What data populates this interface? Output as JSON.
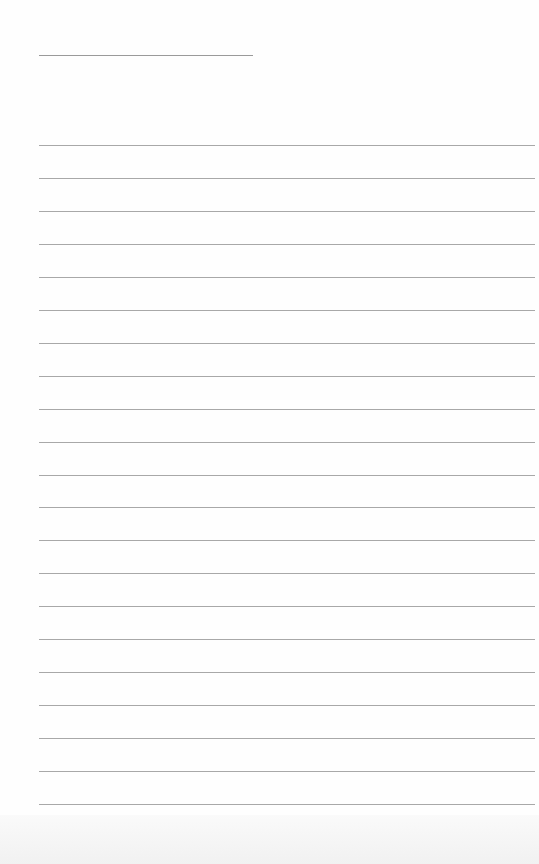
{
  "page": {
    "type": "lined-paper",
    "header_line": {
      "label": ""
    },
    "ruled_lines": {
      "count": 21,
      "first_y": 145,
      "spacing": 32.95
    }
  }
}
